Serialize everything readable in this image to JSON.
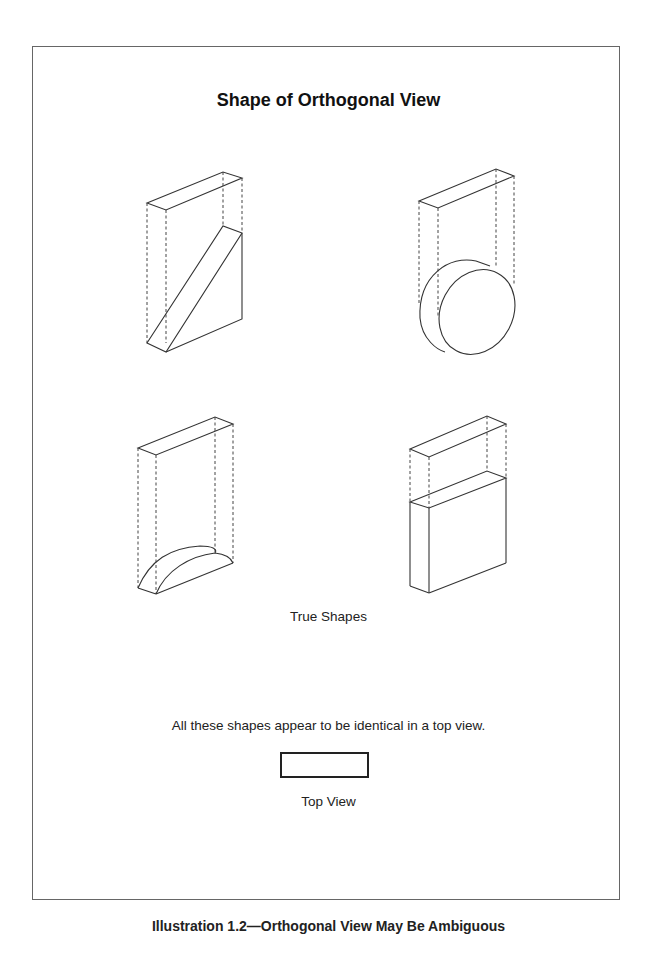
{
  "figure": {
    "title": "Shape of Orthogonal View",
    "true_shapes_label": "True Shapes",
    "statement": "All these shapes appear to be identical in a top view.",
    "top_view_label": "Top View",
    "caption": "Illustration 1.2—Orthogonal View May Be Ambiguous",
    "shapes": [
      {
        "position": "top-left",
        "type": "triangular wedge"
      },
      {
        "position": "top-right",
        "type": "cylinder disc"
      },
      {
        "position": "bottom-left",
        "type": "half-round segment"
      },
      {
        "position": "bottom-right",
        "type": "rectangular slab"
      }
    ]
  }
}
